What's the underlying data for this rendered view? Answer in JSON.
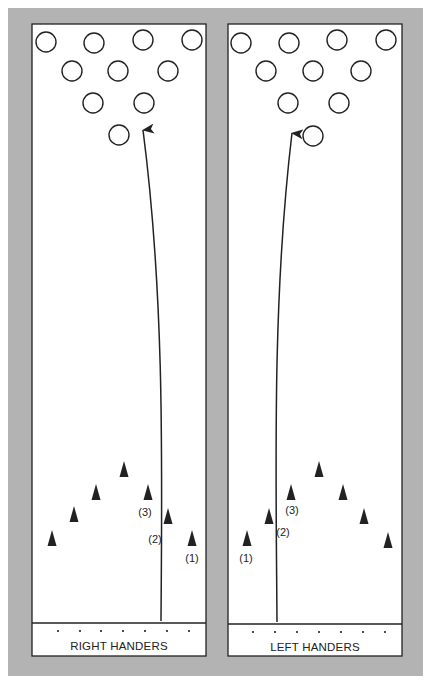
{
  "colors": {
    "background_border": "#b3b3b3",
    "lane_fill": "#ffffff",
    "ink": "#222222"
  },
  "lanes": [
    {
      "id": "right-handers",
      "label": "RIGHT HANDERS",
      "box": {
        "x": 32,
        "y": 24,
        "w": 174,
        "h": 632
      },
      "foul_line_y": 623,
      "approach_dots_y": 631,
      "approach_dots_x": [
        58,
        80,
        101,
        123,
        145,
        167,
        189
      ],
      "pins": [
        {
          "x": 46,
          "y": 42
        },
        {
          "x": 94,
          "y": 43
        },
        {
          "x": 143,
          "y": 40
        },
        {
          "x": 192,
          "y": 40
        },
        {
          "x": 72,
          "y": 71
        },
        {
          "x": 118,
          "y": 71
        },
        {
          "x": 168,
          "y": 71
        },
        {
          "x": 93,
          "y": 103
        },
        {
          "x": 144,
          "y": 103
        },
        {
          "x": 119,
          "y": 135
        }
      ],
      "arrows": [
        {
          "x": 52,
          "y": 538
        },
        {
          "x": 74,
          "y": 514
        },
        {
          "x": 96,
          "y": 492
        },
        {
          "x": 124,
          "y": 469
        },
        {
          "x": 148,
          "y": 492
        },
        {
          "x": 168,
          "y": 516
        },
        {
          "x": 192,
          "y": 538
        }
      ],
      "path": "M161,621 C162,470 165,300 143,130",
      "arrow_tip": {
        "x": 143,
        "y": 128
      },
      "annotations": [
        {
          "text": "(3)",
          "x": 145,
          "y": 516
        },
        {
          "text": "(2)",
          "x": 155,
          "y": 543
        },
        {
          "text": "(1)",
          "x": 192,
          "y": 562
        }
      ]
    },
    {
      "id": "left-handers",
      "label": "LEFT HANDERS",
      "box": {
        "x": 228,
        "y": 24,
        "w": 174,
        "h": 632
      },
      "foul_line_y": 624,
      "approach_dots_y": 632,
      "approach_dots_x": [
        253,
        275,
        297,
        319,
        341,
        363,
        385
      ],
      "pins": [
        {
          "x": 241,
          "y": 43
        },
        {
          "x": 289,
          "y": 43
        },
        {
          "x": 337,
          "y": 40
        },
        {
          "x": 386,
          "y": 40
        },
        {
          "x": 266,
          "y": 71
        },
        {
          "x": 313,
          "y": 71
        },
        {
          "x": 361,
          "y": 71
        },
        {
          "x": 288,
          "y": 103
        },
        {
          "x": 339,
          "y": 103
        },
        {
          "x": 313,
          "y": 136
        }
      ],
      "arrows": [
        {
          "x": 247,
          "y": 538
        },
        {
          "x": 269,
          "y": 516
        },
        {
          "x": 291,
          "y": 492
        },
        {
          "x": 319,
          "y": 469
        },
        {
          "x": 343,
          "y": 492
        },
        {
          "x": 364,
          "y": 516
        },
        {
          "x": 388,
          "y": 540
        }
      ],
      "path": "M277,622 C276,470 272,300 292,133",
      "arrow_tip": {
        "x": 292,
        "y": 131
      },
      "annotations": [
        {
          "text": "(3)",
          "x": 292,
          "y": 514
        },
        {
          "text": "(2)",
          "x": 283,
          "y": 536
        },
        {
          "text": "(1)",
          "x": 246,
          "y": 562
        }
      ]
    }
  ]
}
